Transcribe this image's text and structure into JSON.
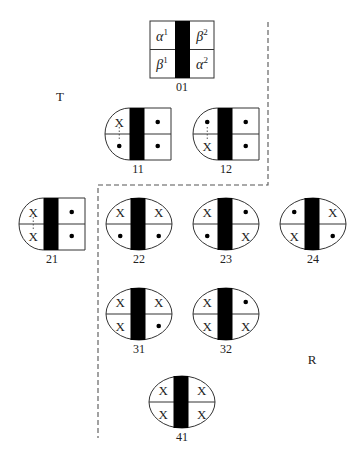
{
  "diagram": {
    "regions": [
      {
        "id": "T",
        "label": "T",
        "x": 60,
        "y": 101
      },
      {
        "id": "R",
        "label": "R",
        "x": 312,
        "y": 364
      }
    ],
    "boundary": {
      "style": "dashed",
      "points": [
        [
          268,
          22
        ],
        [
          268,
          185
        ],
        [
          98,
          185
        ],
        [
          98,
          438
        ]
      ]
    },
    "legend_node": {
      "id": "01",
      "label": "01",
      "cells": {
        "top_left": {
          "symbol": "α",
          "sup": "1"
        },
        "top_right": {
          "symbol": "β",
          "sup": "2"
        },
        "bottom_left": {
          "symbol": "β",
          "sup": "1"
        },
        "bottom_right": {
          "symbol": "α",
          "sup": "2"
        }
      }
    },
    "nodes": [
      {
        "id": "11",
        "label": "11",
        "shape": "left-rounded",
        "cx": 138,
        "cy": 134,
        "cells": [
          "X",
          "•",
          "•",
          "•"
        ],
        "dotted_link": "left"
      },
      {
        "id": "12",
        "label": "12",
        "shape": "left-rounded",
        "cx": 226,
        "cy": 134,
        "cells": [
          "•",
          "•",
          "X",
          "•"
        ],
        "dotted_link": "left"
      },
      {
        "id": "21",
        "label": "21",
        "shape": "left-rounded",
        "cx": 52,
        "cy": 224,
        "cells": [
          "X",
          "•",
          "X",
          "•"
        ],
        "dotted_link": "left"
      },
      {
        "id": "22",
        "label": "22",
        "shape": "ellipse",
        "cx": 139,
        "cy": 224,
        "cells": [
          "X",
          "X",
          "•",
          "•"
        ]
      },
      {
        "id": "23",
        "label": "23",
        "shape": "ellipse",
        "cx": 226,
        "cy": 224,
        "cells": [
          "X",
          "•",
          "•",
          "X"
        ]
      },
      {
        "id": "24",
        "label": "24",
        "shape": "ellipse",
        "cx": 313,
        "cy": 224,
        "cells": [
          "•",
          "X",
          "X",
          "•"
        ]
      },
      {
        "id": "31",
        "label": "31",
        "shape": "ellipse",
        "cx": 139,
        "cy": 314,
        "cells": [
          "X",
          "X",
          "X",
          "•"
        ]
      },
      {
        "id": "32",
        "label": "32",
        "shape": "ellipse",
        "cx": 226,
        "cy": 314,
        "cells": [
          "X",
          "•",
          "X",
          "X"
        ]
      },
      {
        "id": "41",
        "label": "41",
        "shape": "ellipse",
        "cx": 182,
        "cy": 402,
        "cells": [
          "X",
          "X",
          "X",
          "X"
        ]
      }
    ],
    "colors": {
      "bar": "#000000",
      "stroke": "#333333",
      "dash": "#555555",
      "background": "#ffffff"
    }
  }
}
